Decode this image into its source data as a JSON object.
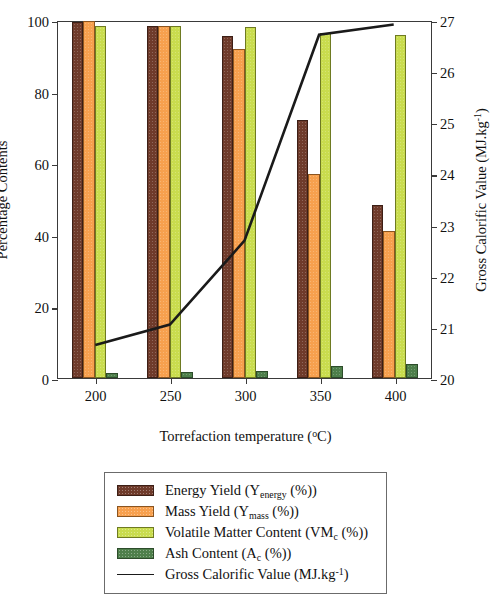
{
  "chart_data": {
    "type": "bar",
    "title": "",
    "xlabel": "Torrefaction temperature (°C)",
    "ylabel": "Percentage Contents",
    "y2label": "Gross Calorific Value (MJ.kg-1)",
    "categories": [
      "200",
      "250",
      "300",
      "350",
      "400"
    ],
    "ylim": [
      0,
      100
    ],
    "yticks": [
      0,
      20,
      40,
      60,
      80,
      100
    ],
    "y2lim": [
      20,
      27
    ],
    "y2ticks": [
      20,
      21,
      22,
      23,
      24,
      25,
      26,
      27
    ],
    "grid": false,
    "legend_position": "below-plot",
    "series": [
      {
        "name": "Energy Yield (Yenergy (%))",
        "axis": "left",
        "type": "bar",
        "color": "#6f3b2b",
        "values": [
          99.4,
          98.2,
          95.5,
          72.0,
          48.3
        ]
      },
      {
        "name": "Mass Yield (Ymass (%))",
        "axis": "left",
        "type": "bar",
        "color": "#f7a04e",
        "values": [
          99.8,
          98.4,
          91.8,
          57.0,
          41.2
        ]
      },
      {
        "name": "Volatile Matter Content (VMc (%))",
        "axis": "left",
        "type": "bar",
        "color": "#c9dc4e",
        "values": [
          98.2,
          98.2,
          98.0,
          96.3,
          95.9
        ]
      },
      {
        "name": "Ash Content (Ac (%))",
        "axis": "left",
        "type": "bar",
        "color": "#4e7f4b",
        "values": [
          1.5,
          1.7,
          2.0,
          3.3,
          4.0
        ]
      },
      {
        "name": "Gross Calorific Value (MJ.kg-1)",
        "axis": "right",
        "type": "line",
        "color": "#1a1a1a",
        "values": [
          20.65,
          21.05,
          22.7,
          26.75,
          26.95
        ]
      }
    ]
  },
  "axes": {
    "left_title_parts": {
      "text": "Percentage Contents"
    },
    "right_title_parts": {
      "pre": "Gross Calorific Value (MJ.kg",
      "sup": "-1",
      "post": ")"
    },
    "x_title_parts": {
      "pre": "Torrefaction temperature (",
      "sup": "o",
      "post": "C)"
    },
    "left_ticks": [
      "100",
      "80",
      "60",
      "40",
      "20",
      "0"
    ],
    "right_ticks": [
      "27",
      "26",
      "25",
      "24",
      "23",
      "22",
      "21",
      "20"
    ],
    "x_ticks": [
      "200",
      "250",
      "300",
      "350",
      "400"
    ]
  },
  "legend": {
    "items": [
      {
        "swatch": "energy",
        "pre": "Energy Yield (Y",
        "sub": "energy",
        "post": " (%))"
      },
      {
        "swatch": "mass",
        "pre": "Mass Yield (Y",
        "sub": "mass",
        "post": " (%))"
      },
      {
        "swatch": "vm",
        "pre": "Volatile Matter Content (VM",
        "sub": "c",
        "post": " (%))"
      },
      {
        "swatch": "ash",
        "pre": "Ash Content (A",
        "sub": "c",
        "post": " (%))"
      },
      {
        "swatch": "line",
        "pre": "Gross Calorific Value (MJ.kg",
        "sup": "-1",
        "post": ")"
      }
    ]
  }
}
